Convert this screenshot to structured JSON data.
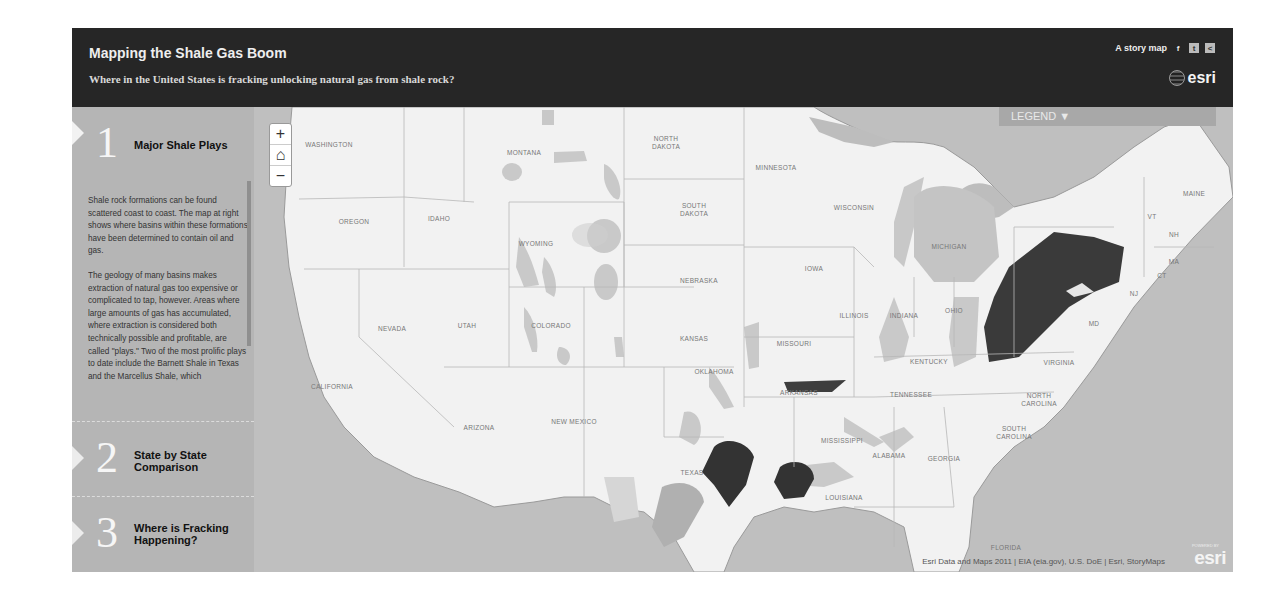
{
  "header": {
    "title": "Mapping the Shale Gas Boom",
    "subtitle": "Where in the United States is fracking unlocking natural gas from shale rock?",
    "story_map_label": "A story map",
    "social": [
      "facebook-icon",
      "twitter-icon",
      "share-icon"
    ],
    "social_glyphs": [
      "f",
      "t",
      "<"
    ],
    "logo": "esri"
  },
  "sidebar": {
    "sections": [
      {
        "number": "1",
        "title": "Major Shale Plays",
        "paragraphs": [
          "Shale rock formations can be found scattered coast to coast. The map at right shows where basins within these formations have been determined to contain oil and gas.",
          "The geology of many basins makes extraction of natural gas too expensive or complicated to tap, however. Areas where large amounts of gas has accumulated, where extraction is considered both technically possible and profitable, are called \"plays.\" Two of the most prolific plays to date include the Barnett Shale in Texas and the Marcellus Shale, which"
        ]
      },
      {
        "number": "2",
        "title": "State by State Comparison"
      },
      {
        "number": "3",
        "title": "Where is Fracking Happening?"
      }
    ]
  },
  "map": {
    "zoom_in": "+",
    "home": "⌂",
    "zoom_out": "−",
    "legend_label": "LEGEND ▼",
    "attribution": "Esri Data and Maps 2011 | EIA (eia.gov), U.S. DoE | Esri, StoryMaps",
    "esri_mark": "esri",
    "powered_by": "POWERED BY",
    "state_labels": [
      {
        "name": "WASHINGTON",
        "x": 75,
        "y": 34
      },
      {
        "name": "MONTANA",
        "x": 270,
        "y": 42
      },
      {
        "name": "NORTH DAKOTA",
        "x": 412,
        "y": 28
      },
      {
        "name": "MINNESOTA",
        "x": 522,
        "y": 57
      },
      {
        "name": "OREGON",
        "x": 100,
        "y": 111
      },
      {
        "name": "IDAHO",
        "x": 185,
        "y": 108
      },
      {
        "name": "WYOMING",
        "x": 282,
        "y": 133
      },
      {
        "name": "SOUTH DAKOTA",
        "x": 440,
        "y": 95
      },
      {
        "name": "WISCONSIN",
        "x": 600,
        "y": 97
      },
      {
        "name": "MICHIGAN",
        "x": 695,
        "y": 136
      },
      {
        "name": "IOWA",
        "x": 560,
        "y": 158
      },
      {
        "name": "NEBRASKA",
        "x": 445,
        "y": 170
      },
      {
        "name": "MAINE",
        "x": 940,
        "y": 83
      },
      {
        "name": "VT",
        "x": 898,
        "y": 106
      },
      {
        "name": "NH",
        "x": 920,
        "y": 124
      },
      {
        "name": "MA",
        "x": 920,
        "y": 151
      },
      {
        "name": "CT",
        "x": 908,
        "y": 165
      },
      {
        "name": "NJ",
        "x": 880,
        "y": 183
      },
      {
        "name": "MD",
        "x": 840,
        "y": 213
      },
      {
        "name": "NEVADA",
        "x": 138,
        "y": 218
      },
      {
        "name": "UTAH",
        "x": 213,
        "y": 215
      },
      {
        "name": "COLORADO",
        "x": 297,
        "y": 215
      },
      {
        "name": "KANSAS",
        "x": 440,
        "y": 228
      },
      {
        "name": "MISSOURI",
        "x": 540,
        "y": 233
      },
      {
        "name": "ILLINOIS",
        "x": 600,
        "y": 205
      },
      {
        "name": "INDIANA",
        "x": 650,
        "y": 205
      },
      {
        "name": "OHIO",
        "x": 700,
        "y": 200
      },
      {
        "name": "KENTUCKY",
        "x": 675,
        "y": 251
      },
      {
        "name": "VIRGINIA",
        "x": 805,
        "y": 252
      },
      {
        "name": "CALIFORNIA",
        "x": 78,
        "y": 276
      },
      {
        "name": "OKLAHOMA",
        "x": 460,
        "y": 261
      },
      {
        "name": "ARKANSAS",
        "x": 545,
        "y": 282
      },
      {
        "name": "TENNESSEE",
        "x": 657,
        "y": 284
      },
      {
        "name": "NORTH CAROLINA",
        "x": 785,
        "y": 285
      },
      {
        "name": "ARIZONA",
        "x": 225,
        "y": 317
      },
      {
        "name": "NEW MEXICO",
        "x": 320,
        "y": 311
      },
      {
        "name": "MISSISSIPPI",
        "x": 588,
        "y": 330
      },
      {
        "name": "SOUTH CAROLINA",
        "x": 760,
        "y": 318
      },
      {
        "name": "ALABAMA",
        "x": 635,
        "y": 345
      },
      {
        "name": "GEORGIA",
        "x": 690,
        "y": 348
      },
      {
        "name": "TEXAS",
        "x": 438,
        "y": 362
      },
      {
        "name": "LOUISIANA",
        "x": 590,
        "y": 387
      },
      {
        "name": "FLORIDA",
        "x": 752,
        "y": 437
      }
    ]
  }
}
